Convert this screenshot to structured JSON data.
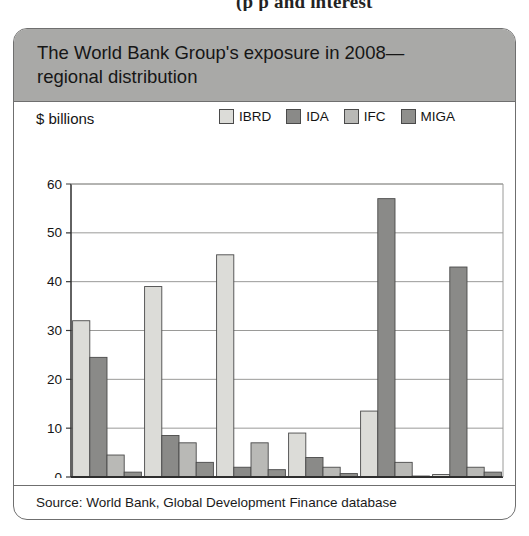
{
  "page_top_bleed": "(p        p      and interest",
  "figure": {
    "title": "The World Bank Group's exposure in 2008—regional distribution",
    "units_label": "$ billions",
    "source": "Source: World Bank, Global Development Finance database"
  },
  "colors": {
    "title_band": "#a9a9a7",
    "border": "#6f6f6f",
    "IBRD": "#dcdcd8",
    "IDA": "#8a8a88",
    "IFC": "#b9b9b6",
    "MIGA": "#8f8f8c",
    "bar_outline": "#4a4a4a",
    "gridline": "#9a9a98"
  },
  "chart_data": {
    "type": "bar",
    "title": "The World Bank Group's exposure in 2008—regional distribution",
    "xlabel": "",
    "ylabel": "$ billions",
    "ylim": [
      0,
      60
    ],
    "yticks": [
      0,
      10,
      20,
      30,
      40,
      50,
      60
    ],
    "ytick_labels": [
      "0",
      "10",
      "20",
      "30",
      "40",
      "50",
      "60"
    ],
    "grid": true,
    "legend_position": "top-right",
    "categories": [
      "East Asia & Pacific",
      "Europe & Central Asia",
      "Latin America & Caribbean",
      "Middle East & North Africa",
      "South Asia",
      "Sub-Saharan Africa"
    ],
    "category_lines": [
      [
        "East Asia",
        "& Pacific"
      ],
      [
        "Europe &",
        "Central",
        "Asia"
      ],
      [
        "Latin",
        "America &",
        "Caribbean"
      ],
      [
        "Middle East",
        "& North",
        "Africa"
      ],
      [
        "South",
        "Asia"
      ],
      [
        "Sub-",
        "Saharan",
        "Africa"
      ]
    ],
    "series": [
      {
        "name": "IBRD",
        "color": "#dcdcd8",
        "values": [
          32.0,
          39.0,
          45.5,
          9.0,
          13.5,
          0.5
        ]
      },
      {
        "name": "IDA",
        "color": "#8a8a88",
        "values": [
          24.5,
          8.5,
          2.0,
          4.0,
          57.0,
          43.0
        ]
      },
      {
        "name": "IFC",
        "color": "#b9b9b6",
        "values": [
          4.5,
          7.0,
          7.0,
          2.0,
          3.0,
          2.0
        ]
      },
      {
        "name": "MIGA",
        "color": "#8f8f8c",
        "values": [
          1.0,
          3.0,
          1.5,
          0.7,
          0.2,
          1.0
        ]
      }
    ]
  }
}
